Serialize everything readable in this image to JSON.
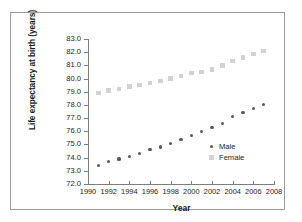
{
  "chart_data": {
    "type": "scatter",
    "title": "",
    "xlabel": "Year",
    "ylabel": "Life expectancy at birth (years)",
    "xlim": [
      1990,
      2008
    ],
    "ylim": [
      72.0,
      83.0
    ],
    "xticks": [
      "1990",
      "1992",
      "1994",
      "1996",
      "1998",
      "2000",
      "2002",
      "2004",
      "2006",
      "2008"
    ],
    "yticks": [
      "72.0",
      "73.0",
      "74.0",
      "75.0",
      "76.0",
      "77.0",
      "78.0",
      "79.0",
      "80.0",
      "81.0",
      "82.0",
      "83.0"
    ],
    "grid": false,
    "legend_position": "inside-right",
    "x": [
      1991,
      1992,
      1993,
      1994,
      1995,
      1996,
      1997,
      1998,
      1999,
      2000,
      2001,
      2002,
      2003,
      2004,
      2005,
      2006,
      2007
    ],
    "series": [
      {
        "name": "Male",
        "marker": "diamond",
        "color": "#58585a",
        "values": [
          73.4,
          73.7,
          73.9,
          74.1,
          74.3,
          74.6,
          74.8,
          75.1,
          75.4,
          75.7,
          76.0,
          76.3,
          76.6,
          77.1,
          77.4,
          77.7,
          78.0
        ]
      },
      {
        "name": "Female",
        "marker": "square",
        "color": "#d2d2d4",
        "values": [
          78.9,
          79.1,
          79.2,
          79.4,
          79.5,
          79.65,
          79.8,
          80.0,
          80.2,
          80.4,
          80.5,
          80.7,
          81.0,
          81.35,
          81.6,
          81.85,
          82.1
        ]
      }
    ]
  },
  "legend": {
    "male_label": "Male",
    "female_label": "Female"
  },
  "axes": {
    "x_title": "Year",
    "y_title": "Life expectancy at birth (years)"
  }
}
